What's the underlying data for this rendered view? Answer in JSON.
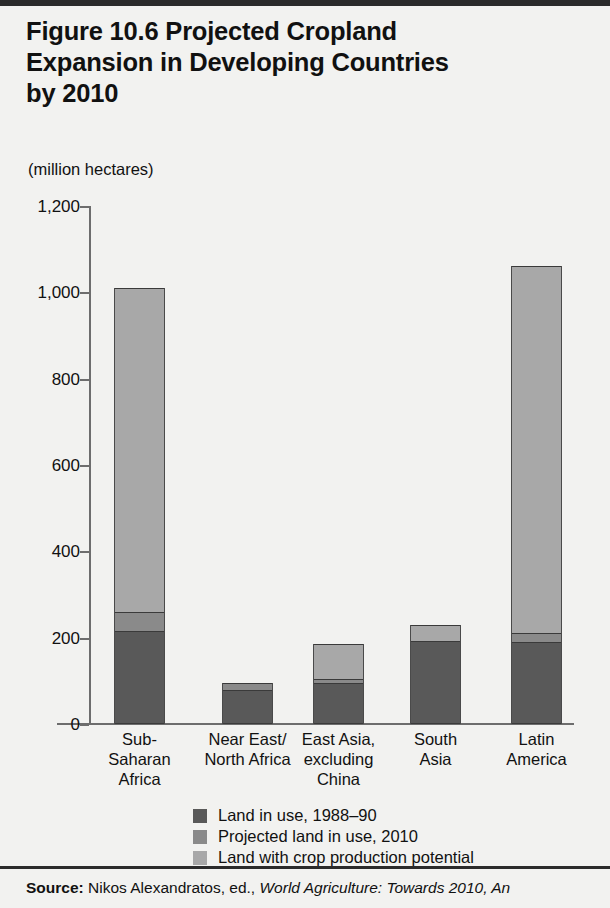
{
  "figure": {
    "title": "Figure 10.6  Projected Cropland Expansion in Developing Countries by 2010",
    "title_lines": [
      "Figure 10.6  Projected Cropland",
      "Expansion in Developing Countries",
      "by 2010"
    ],
    "axis_unit": "(million hectares)"
  },
  "source": {
    "lead": "Source:",
    "text_plain": " Nikos Alexandratos, ed., ",
    "text_italic": "World Agriculture: Towards 2010, An"
  },
  "colors": {
    "dark": "#595959",
    "medium": "#8a8a8a",
    "light": "#a8a8a8",
    "background": "#f2f2f0",
    "axis": "#6d6d6d",
    "text": "#111111",
    "rule": "#2b2b2b"
  },
  "legend": [
    {
      "label": "Land in use, 1988–90",
      "color": "#595959",
      "key": "land-in-use"
    },
    {
      "label": "Projected land in use, 2010",
      "color": "#8a8a8a",
      "key": "projected-land"
    },
    {
      "label": "Land with crop production potential",
      "color": "#a8a8a8",
      "key": "crop-potential"
    }
  ],
  "chart_data": {
    "type": "bar",
    "subtype": "stacked",
    "title": "Figure 10.6  Projected Cropland Expansion in Developing Countries by 2010",
    "xlabel": "",
    "ylabel": "(million hectares)",
    "ylim": [
      0,
      1200
    ],
    "yticks": [
      0,
      200,
      400,
      600,
      800,
      1000,
      1200
    ],
    "ytick_labels": [
      "0",
      "200",
      "400",
      "600",
      "800",
      "1,000",
      "1,200"
    ],
    "grid": false,
    "legend_position": "bottom",
    "categories": [
      "Sub-Saharan Africa",
      "Near East/ North Africa",
      "East Asia, excluding China",
      "South Asia",
      "Latin America"
    ],
    "category_label_lines": [
      [
        "Sub-",
        "Saharan",
        "Africa"
      ],
      [
        "Near East/",
        "North Africa"
      ],
      [
        "East Asia,",
        "excluding",
        "China"
      ],
      [
        "South",
        "Asia"
      ],
      [
        "Latin",
        "America"
      ]
    ],
    "series": [
      {
        "name": "Land in use, 1988–90",
        "color": "#595959",
        "values": [
          215,
          78,
          95,
          192,
          190
        ]
      },
      {
        "name": "Projected land in use, 2010",
        "color": "#8a8a8a",
        "values": [
          45,
          16,
          10,
          0,
          20
        ]
      },
      {
        "name": "Land with crop production potential",
        "color": "#a8a8a8",
        "values": [
          750,
          0,
          80,
          38,
          850
        ]
      }
    ],
    "totals": [
      1010,
      94,
      185,
      230,
      1060
    ],
    "cumulative_tops": [
      {
        "category": "Sub-Saharan Africa",
        "dark_top": 215,
        "medium_top": 260,
        "light_top": 1010
      },
      {
        "category": "Near East/ North Africa",
        "dark_top": 78,
        "medium_top": 94,
        "light_top": 94
      },
      {
        "category": "East Asia, excluding China",
        "dark_top": 95,
        "medium_top": 105,
        "light_top": 185
      },
      {
        "category": "South Asia",
        "dark_top": 192,
        "medium_top": 192,
        "light_top": 230
      },
      {
        "category": "Latin America",
        "dark_top": 190,
        "medium_top": 210,
        "light_top": 1060
      }
    ]
  }
}
